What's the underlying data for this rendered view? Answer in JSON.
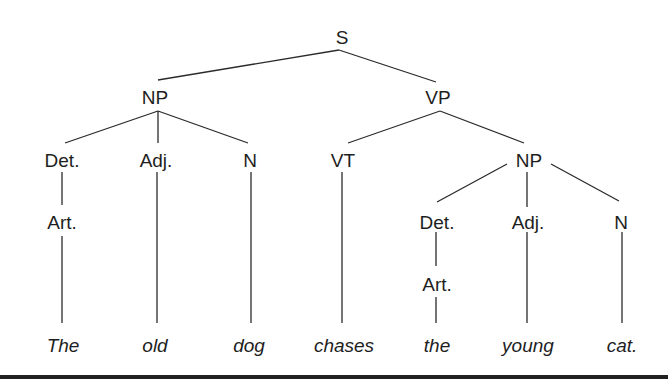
{
  "diagram": {
    "type": "syntax-tree",
    "sentence": "The old dog chases the young cat.",
    "nodes": {
      "s": "S",
      "np_subject": "NP",
      "vp": "VP",
      "det_1": "Det.",
      "adj_1": "Adj.",
      "n_1": "N",
      "art_1": "Art.",
      "vt": "VT",
      "np_object": "NP",
      "det_2": "Det.",
      "adj_2": "Adj.",
      "n_2": "N",
      "art_2": "Art."
    },
    "words": {
      "w1": "The",
      "w2": "old",
      "w3": "dog",
      "w4": "chases",
      "w5": "the",
      "w6": "young",
      "w7": "cat."
    },
    "structure": [
      {
        "parent": "S",
        "children": [
          "NP",
          "VP"
        ]
      },
      {
        "parent": "NP (subject)",
        "children": [
          "Det.",
          "Adj.",
          "N"
        ]
      },
      {
        "parent": "Det. (subject)",
        "children": [
          "Art."
        ]
      },
      {
        "parent": "VP",
        "children": [
          "VT",
          "NP"
        ]
      },
      {
        "parent": "NP (object)",
        "children": [
          "Det.",
          "Adj.",
          "N"
        ]
      },
      {
        "parent": "Det. (object)",
        "children": [
          "Art."
        ]
      }
    ]
  }
}
